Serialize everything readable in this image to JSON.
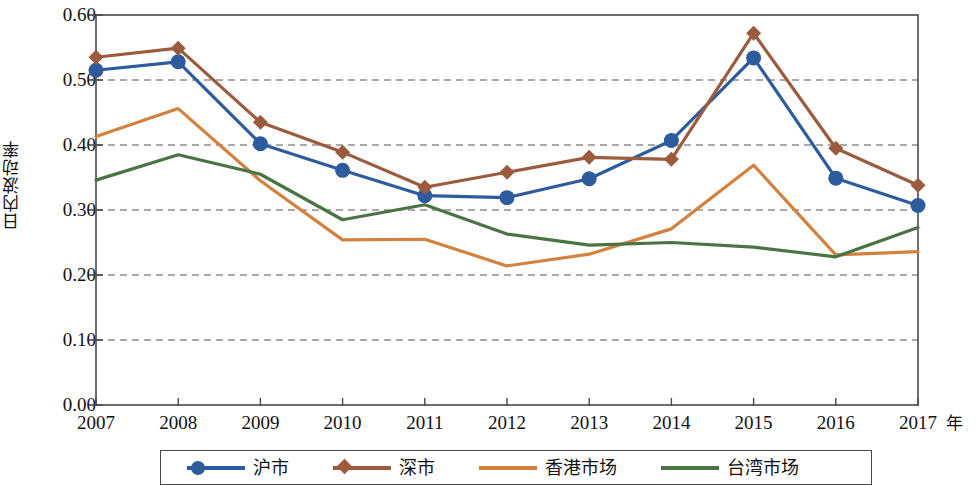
{
  "chart_data": {
    "type": "line",
    "title": "",
    "xlabel": "年",
    "ylabel": "日内波动率",
    "categories": [
      "2007",
      "2008",
      "2009",
      "2010",
      "2011",
      "2012",
      "2013",
      "2014",
      "2015",
      "2016",
      "2017"
    ],
    "x": [
      2007,
      2008,
      2009,
      2010,
      2011,
      2012,
      2013,
      2014,
      2015,
      2016,
      2017
    ],
    "xlim": [
      2007,
      2017
    ],
    "ylim": [
      0.0,
      0.6
    ],
    "yticks": [
      "0.00",
      "0.10",
      "0.20",
      "0.30",
      "0.40",
      "0.50",
      "0.60"
    ],
    "ytick_values": [
      0.0,
      0.1,
      0.2,
      0.3,
      0.4,
      0.5,
      0.6
    ],
    "grid": "horizontal-dashed",
    "legend_position": "bottom",
    "series": [
      {
        "name": "沪市",
        "color": "#2E5B9E",
        "marker": "circle",
        "values": [
          0.515,
          0.528,
          0.402,
          0.361,
          0.322,
          0.319,
          0.348,
          0.407,
          0.534,
          0.349,
          0.307
        ]
      },
      {
        "name": "深市",
        "color": "#9C5B3C",
        "marker": "diamond",
        "values": [
          0.535,
          0.549,
          0.435,
          0.389,
          0.335,
          0.358,
          0.381,
          0.378,
          0.572,
          0.395,
          0.338
        ]
      },
      {
        "name": "香港市场",
        "color": "#D2813E",
        "marker": "none",
        "values": [
          0.413,
          0.456,
          0.345,
          0.254,
          0.255,
          0.214,
          0.232,
          0.271,
          0.369,
          0.231,
          0.236
        ]
      },
      {
        "name": "台湾市场",
        "color": "#4A7444",
        "marker": "none",
        "values": [
          0.346,
          0.385,
          0.355,
          0.285,
          0.308,
          0.263,
          0.246,
          0.25,
          0.243,
          0.228,
          0.273
        ]
      }
    ]
  },
  "axis": {
    "y_title": "日内波动率",
    "x_unit": "年"
  },
  "legend": {
    "entries": [
      {
        "label": "沪市"
      },
      {
        "label": "深市"
      },
      {
        "label": "香港市场"
      },
      {
        "label": "台湾市场"
      }
    ]
  }
}
